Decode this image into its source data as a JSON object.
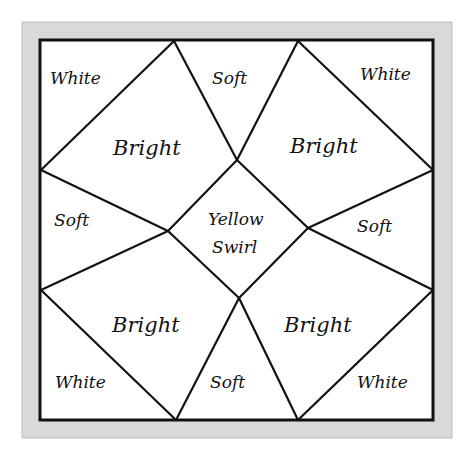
{
  "diagram": {
    "type": "quilt-block-color-plan",
    "colors": {
      "frame": "#d9d9d9",
      "frame_edge": "#bdbdbd",
      "line": "#111111",
      "background": "#ffffff"
    },
    "regions": {
      "white_top_left": "White",
      "soft_top": "Soft",
      "white_top_right": "White",
      "bright_top_left": "Bright",
      "bright_top_right": "Bright",
      "soft_left": "Soft",
      "center_line1": "Yellow",
      "center_line2": "Swirl",
      "soft_right": "Soft",
      "bright_bottom_left": "Bright",
      "bright_bottom_right": "Bright",
      "white_bottom_left": "White",
      "soft_bottom": "Soft",
      "white_bottom_right": "White"
    }
  }
}
